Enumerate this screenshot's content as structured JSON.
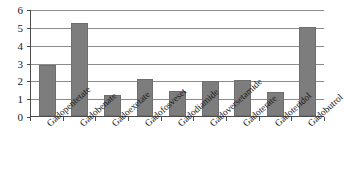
{
  "chart_data": {
    "type": "bar",
    "title": "",
    "subtitle": "",
    "xlabel": "",
    "ylabel": "",
    "categories": [
      "Gadopentetate",
      "Gadobenate",
      "Gadoexetate",
      "Gadofosveset",
      "Gadodiamide",
      "Gadoversetamide",
      "Gadoterate",
      "Gadoteridol",
      "Gadobutrol"
    ],
    "values": [
      2.9,
      5.25,
      1.2,
      2.1,
      1.4,
      2.0,
      2.05,
      1.35,
      5.05
    ],
    "ylim": [
      0,
      6
    ],
    "yticks": [
      0,
      1,
      2,
      3,
      4,
      5,
      6
    ],
    "ytick_labels": [
      "0",
      "1",
      "2",
      "3",
      "4",
      "5",
      "6"
    ],
    "grid": true,
    "legend": false,
    "legend_position": "none",
    "bar_color": "#7d7d7d",
    "axis_color": "#4d4d4d",
    "grid_color": "#8c8c8c"
  }
}
